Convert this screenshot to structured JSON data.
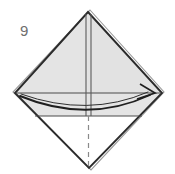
{
  "figure": {
    "kind": "origami-fold-diagram",
    "step_number": "9",
    "canvas": {
      "width": 175,
      "height": 174
    },
    "background_color": "#ffffff"
  },
  "palette": {
    "paper_fill": "#e2e2e2",
    "paper_fill_light": "#eaeaea",
    "paper_white": "#ffffff",
    "outline_dark": "#2b2b2b",
    "outline_mid": "#6a6a6a",
    "crease_line": "#555555",
    "dashed_line": "#8a8a8a",
    "arrow_color": "#1f1f1f",
    "number_color": "#6e6e6e"
  },
  "geometry": {
    "diamond": {
      "top": {
        "x": 88,
        "y": 12
      },
      "right": {
        "x": 162,
        "y": 93
      },
      "bottom": {
        "x": 89,
        "y": 168
      },
      "left": {
        "x": 15,
        "y": 93
      }
    },
    "upper_triangle_fill": "#e2e2e2",
    "lower_triangle_fill": "#ffffff",
    "middle_band": {
      "top_edge_y": 93,
      "bottom_edge_y": 116,
      "fill": "#e4e4e4"
    },
    "center_fold_lines": [
      {
        "x": 86,
        "y1": 14,
        "y2": 116
      },
      {
        "x": 91,
        "y1": 14,
        "y2": 116
      }
    ],
    "horizontal_creases": [
      {
        "y": 93,
        "x1": 17,
        "x2": 160
      },
      {
        "y": 116,
        "x1": 34,
        "x2": 143
      }
    ],
    "dashed_center_line": {
      "x": 88.5,
      "y1": 116,
      "y2": 166
    }
  },
  "annotations": {
    "step_label": "9",
    "arrow": {
      "name": "fold-arrow",
      "direction": "left-to-right-sweep",
      "start": {
        "x": 20,
        "y": 96
      },
      "control": {
        "x": 88,
        "y": 122
      },
      "end": {
        "x": 152,
        "y": 94
      },
      "head_tip": {
        "x": 154,
        "y": 93
      },
      "description": "Curved sweeping arrow indicating the flap is folded across to the right"
    }
  },
  "labels": {
    "diagram_title": "Origami step 9 diagram",
    "upper_triangle": "upper shaded triangle",
    "lower_triangle": "lower white triangle",
    "middle_band": "folded horizontal band"
  }
}
